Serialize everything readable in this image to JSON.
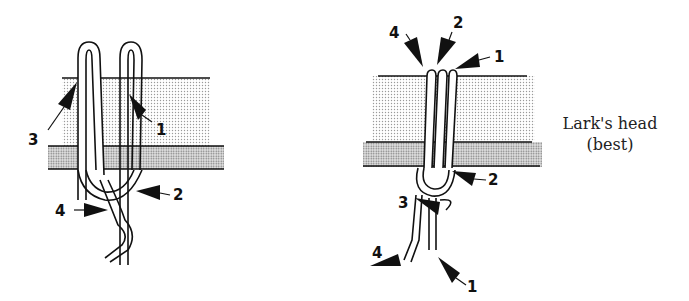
{
  "figures": [
    {
      "id": "left",
      "description": "Knot wrapped around a layered board (two loops over top edge)",
      "labels": [
        "1",
        "2",
        "3",
        "4"
      ]
    },
    {
      "id": "right",
      "description": "Lark's head knot around layered board",
      "labels_top": [
        "4",
        "2",
        "1"
      ],
      "labels_bottom": [
        "2",
        "3",
        "4",
        "1"
      ],
      "caption_line1": "Lark's head",
      "caption_line2": "(best)"
    }
  ],
  "colors": {
    "ink": "#111111",
    "board_light": "#d8d8d8",
    "board_dark": "#b8b8b8",
    "background": "#ffffff"
  }
}
